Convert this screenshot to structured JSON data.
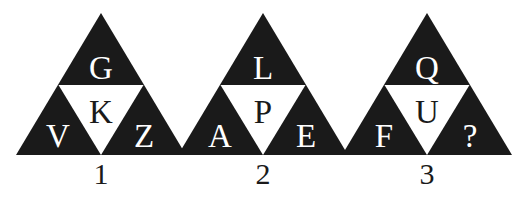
{
  "background_color": "#ffffff",
  "ink_color": "#1a1a1a",
  "paper_color": "#ffffff",
  "puzzle": {
    "type": "letter-triangle-puzzle",
    "triangles": [
      {
        "number": "1",
        "top": "G",
        "middle": "K",
        "left": "V",
        "right": "Z"
      },
      {
        "number": "2",
        "top": "L",
        "middle": "P",
        "left": "A",
        "right": "E"
      },
      {
        "number": "3",
        "top": "Q",
        "middle": "U",
        "left": "F",
        "right": "?"
      }
    ]
  }
}
